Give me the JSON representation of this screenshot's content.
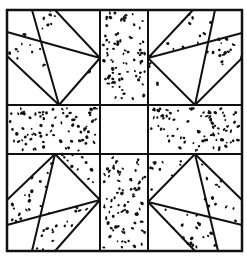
{
  "colors": {
    "line": "#111111",
    "background": "#ffffff",
    "speckle": "#111111"
  },
  "outer": {
    "x1": 7,
    "y1": 10,
    "x2": 242,
    "y2": 251
  },
  "grid": {
    "vx": [
      100,
      148
    ],
    "hy": [
      105,
      154
    ]
  },
  "corners": [
    {
      "name": "top-left",
      "lines": [
        [
          32,
          10,
          59,
          105
        ],
        [
          55,
          10,
          100,
          58
        ],
        [
          7,
          32,
          100,
          58
        ],
        [
          7,
          56,
          59,
          105
        ],
        [
          100,
          58,
          59,
          105
        ]
      ],
      "speckled": [
        [
          [
            32,
            10
          ],
          [
            55,
            10
          ],
          [
            72,
            28
          ],
          [
            45,
            36
          ]
        ],
        [
          [
            7,
            32
          ],
          [
            45,
            36
          ],
          [
            53,
            75
          ],
          [
            7,
            56
          ]
        ],
        [
          [
            100,
            58
          ],
          [
            59,
            105
          ],
          [
            74,
            88
          ],
          [
            100,
            70
          ]
        ]
      ]
    },
    {
      "name": "top-right",
      "lines": [
        [
          215,
          10,
          195,
          105
        ],
        [
          193,
          10,
          148,
          58
        ],
        [
          148,
          58,
          242,
          33
        ],
        [
          242,
          58,
          195,
          105
        ],
        [
          148,
          58,
          195,
          105
        ]
      ],
      "speckled": [
        [
          [
            193,
            10
          ],
          [
            215,
            10
          ],
          [
            210,
            40
          ],
          [
            148,
            58
          ]
        ],
        [
          [
            210,
            40
          ],
          [
            242,
            33
          ],
          [
            242,
            58
          ],
          [
            198,
            90
          ]
        ],
        [
          [
            148,
            58
          ],
          [
            165,
            88
          ],
          [
            190,
            103
          ],
          [
            148,
            80
          ]
        ]
      ]
    },
    {
      "name": "bottom-left",
      "lines": [
        [
          55,
          154,
          32,
          251
        ],
        [
          55,
          154,
          100,
          200
        ],
        [
          7,
          225,
          100,
          200
        ],
        [
          7,
          200,
          55,
          154
        ],
        [
          55,
          251,
          100,
          200
        ]
      ],
      "speckled": [
        [
          [
            7,
            200
          ],
          [
            55,
            154
          ],
          [
            42,
            215
          ],
          [
            7,
            225
          ]
        ],
        [
          [
            42,
            215
          ],
          [
            100,
            200
          ],
          [
            55,
            251
          ],
          [
            32,
            251
          ]
        ],
        [
          [
            60,
            154
          ],
          [
            100,
            154
          ],
          [
            100,
            198
          ],
          [
            75,
            170
          ]
        ]
      ]
    },
    {
      "name": "bottom-right",
      "lines": [
        [
          195,
          154,
          218,
          251
        ],
        [
          195,
          154,
          148,
          202
        ],
        [
          148,
          202,
          242,
          225
        ],
        [
          242,
          200,
          195,
          154
        ],
        [
          148,
          202,
          195,
          251
        ]
      ],
      "speckled": [
        [
          [
            195,
            154
          ],
          [
            242,
            200
          ],
          [
            242,
            225
          ],
          [
            208,
            218
          ]
        ],
        [
          [
            148,
            202
          ],
          [
            208,
            218
          ],
          [
            218,
            251
          ],
          [
            195,
            251
          ]
        ],
        [
          [
            148,
            154
          ],
          [
            190,
            154
          ],
          [
            160,
            190
          ],
          [
            148,
            200
          ]
        ]
      ]
    }
  ],
  "speckled_rects": [
    {
      "name": "top-center",
      "x": 100,
      "y": 10,
      "w": 48,
      "h": 95
    },
    {
      "name": "middle-left",
      "x": 7,
      "y": 105,
      "w": 93,
      "h": 49
    },
    {
      "name": "middle-right",
      "x": 148,
      "y": 105,
      "w": 94,
      "h": 49
    },
    {
      "name": "bottom-center",
      "x": 100,
      "y": 154,
      "w": 48,
      "h": 97
    }
  ]
}
